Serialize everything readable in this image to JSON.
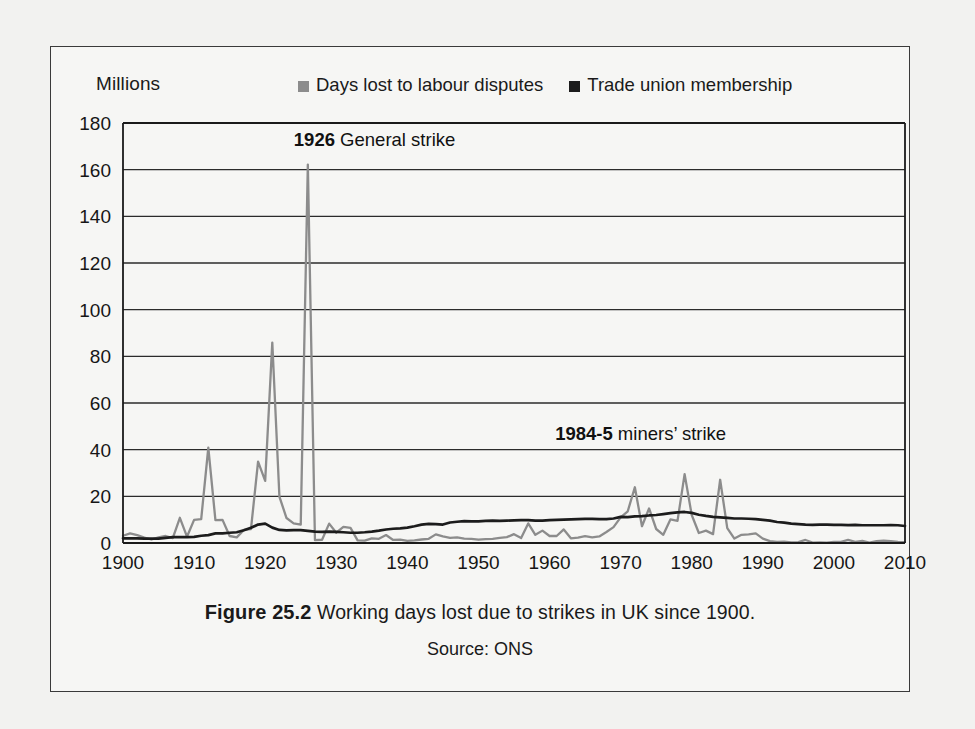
{
  "figure": {
    "axis_unit_label": "Millions",
    "caption_figure_no": "Figure 25.2",
    "caption_text": "Working days lost due to strikes in UK since 1900.",
    "caption_source": "Source: ONS"
  },
  "colors": {
    "days_lost": "#8c8c8c",
    "union_membership": "#1c1c1c",
    "axis": "#1a1a1a",
    "grid": "#2b2b2b",
    "paper": "#f2f2f0",
    "figure_bg": "#f6f6f4",
    "border": "#3a3a3a"
  },
  "annotations": [
    {
      "year_label": "1926",
      "text": " General strike",
      "x_year": 1926,
      "y_value": 170
    },
    {
      "year_label": "1984-5",
      "text": " miners’ strike",
      "x_year": 1984,
      "y_value": 44
    }
  ],
  "chart_data": {
    "type": "line",
    "title": "Working days lost due to strikes in UK since 1900.",
    "subtitle": "Source: ONS",
    "xlabel": "",
    "ylabel": "Millions",
    "xlim": [
      1900,
      2010
    ],
    "ylim": [
      0,
      180
    ],
    "ytick_step": 20,
    "xtick_step": 10,
    "grid": "horizontal",
    "legend_position": "top",
    "ytick_labels": [
      "0",
      "20",
      "40",
      "60",
      "80",
      "100",
      "120",
      "140",
      "160",
      "180"
    ],
    "ytick_values": [
      0,
      20,
      40,
      60,
      80,
      100,
      120,
      140,
      160,
      180
    ],
    "xtick_labels": [
      "1900",
      "1910",
      "1920",
      "1930",
      "1940",
      "1950",
      "1960",
      "1970",
      "1980",
      "1990",
      "2000",
      "2010"
    ],
    "xtick_values": [
      1900,
      1910,
      1920,
      1930,
      1940,
      1950,
      1960,
      1970,
      1980,
      1990,
      2000,
      2010
    ],
    "series": [
      {
        "name": "Days lost to labour disputes",
        "color": "#8c8c8c",
        "x": [
          1900,
          1901,
          1902,
          1903,
          1904,
          1905,
          1906,
          1907,
          1908,
          1909,
          1910,
          1911,
          1912,
          1913,
          1914,
          1915,
          1916,
          1917,
          1918,
          1919,
          1920,
          1921,
          1922,
          1923,
          1924,
          1925,
          1926,
          1927,
          1928,
          1929,
          1930,
          1931,
          1932,
          1933,
          1934,
          1935,
          1936,
          1937,
          1938,
          1939,
          1940,
          1941,
          1942,
          1943,
          1944,
          1945,
          1946,
          1947,
          1948,
          1949,
          1950,
          1951,
          1952,
          1953,
          1954,
          1955,
          1956,
          1957,
          1958,
          1959,
          1960,
          1961,
          1962,
          1963,
          1964,
          1965,
          1966,
          1967,
          1968,
          1969,
          1970,
          1971,
          1972,
          1973,
          1974,
          1975,
          1976,
          1977,
          1978,
          1979,
          1980,
          1981,
          1982,
          1983,
          1984,
          1985,
          1986,
          1987,
          1988,
          1989,
          1990,
          1991,
          1992,
          1993,
          1994,
          1995,
          1996,
          1997,
          1998,
          1999,
          2000,
          2001,
          2002,
          2003,
          2004,
          2005,
          2006,
          2007,
          2008,
          2009,
          2010
        ],
        "y": [
          3.1,
          4.1,
          3.4,
          2.3,
          1.5,
          2.4,
          3.0,
          2.1,
          10.8,
          2.7,
          9.9,
          10.2,
          40.9,
          9.8,
          9.9,
          3.0,
          2.4,
          5.6,
          5.9,
          34.9,
          26.6,
          85.9,
          19.9,
          10.7,
          8.4,
          7.9,
          162.2,
          1.2,
          1.4,
          8.3,
          4.4,
          6.9,
          6.5,
          1.1,
          1.0,
          2.0,
          1.8,
          3.4,
          1.3,
          1.4,
          0.9,
          1.1,
          1.5,
          1.8,
          3.7,
          2.8,
          2.2,
          2.4,
          1.9,
          1.8,
          1.4,
          1.7,
          1.8,
          2.2,
          2.5,
          3.8,
          2.1,
          8.4,
          3.5,
          5.3,
          3.0,
          3.0,
          5.8,
          2.0,
          2.3,
          2.9,
          2.4,
          2.8,
          4.7,
          6.8,
          11.0,
          13.6,
          23.9,
          7.2,
          14.8,
          6.0,
          3.5,
          10.1,
          9.5,
          29.5,
          12.0,
          4.3,
          5.3,
          3.8,
          27.1,
          6.4,
          1.9,
          3.5,
          3.7,
          4.1,
          1.9,
          0.8,
          0.5,
          0.6,
          0.3,
          0.4,
          1.3,
          0.2,
          0.3,
          0.2,
          0.5,
          0.5,
          1.3,
          0.5,
          0.9,
          0.2,
          0.8,
          1.0,
          0.8,
          0.5,
          0.4
        ]
      },
      {
        "name": "Trade union membership",
        "color": "#1c1c1c",
        "x": [
          1900,
          1901,
          1902,
          1903,
          1904,
          1905,
          1906,
          1907,
          1908,
          1909,
          1910,
          1911,
          1912,
          1913,
          1914,
          1915,
          1916,
          1917,
          1918,
          1919,
          1920,
          1921,
          1922,
          1923,
          1924,
          1925,
          1926,
          1927,
          1928,
          1929,
          1930,
          1931,
          1932,
          1933,
          1934,
          1935,
          1936,
          1937,
          1938,
          1939,
          1940,
          1941,
          1942,
          1943,
          1944,
          1945,
          1946,
          1947,
          1948,
          1949,
          1950,
          1951,
          1952,
          1953,
          1954,
          1955,
          1956,
          1957,
          1958,
          1959,
          1960,
          1961,
          1962,
          1963,
          1964,
          1965,
          1966,
          1967,
          1968,
          1969,
          1970,
          1971,
          1972,
          1973,
          1974,
          1975,
          1976,
          1977,
          1978,
          1979,
          1980,
          1981,
          1982,
          1983,
          1984,
          1985,
          1986,
          1987,
          1988,
          1989,
          1990,
          1991,
          1992,
          1993,
          1994,
          1995,
          1996,
          1997,
          1998,
          1999,
          2000,
          2001,
          2002,
          2003,
          2004,
          2005,
          2006,
          2007,
          2008,
          2009,
          2010
        ],
        "y": [
          2.0,
          2.0,
          2.0,
          1.9,
          1.9,
          1.9,
          2.2,
          2.5,
          2.5,
          2.5,
          2.6,
          3.1,
          3.4,
          4.1,
          4.1,
          4.4,
          4.6,
          5.5,
          6.5,
          7.9,
          8.3,
          6.6,
          5.6,
          5.4,
          5.5,
          5.5,
          5.2,
          4.9,
          4.8,
          4.9,
          4.8,
          4.6,
          4.4,
          4.4,
          4.6,
          4.9,
          5.3,
          5.8,
          6.1,
          6.3,
          6.6,
          7.2,
          7.9,
          8.2,
          8.1,
          7.9,
          8.8,
          9.1,
          9.4,
          9.3,
          9.3,
          9.5,
          9.6,
          9.5,
          9.6,
          9.7,
          9.8,
          9.8,
          9.6,
          9.6,
          9.8,
          9.9,
          10.0,
          10.1,
          10.2,
          10.3,
          10.3,
          10.2,
          10.2,
          10.5,
          11.2,
          11.1,
          11.4,
          11.5,
          11.8,
          12.0,
          12.4,
          12.8,
          13.1,
          13.3,
          12.9,
          12.1,
          11.6,
          11.2,
          11.0,
          10.8,
          10.5,
          10.5,
          10.4,
          10.2,
          9.9,
          9.6,
          9.0,
          8.7,
          8.3,
          8.1,
          7.9,
          7.8,
          7.9,
          7.9,
          7.8,
          7.8,
          7.7,
          7.8,
          7.6,
          7.6,
          7.6,
          7.6,
          7.7,
          7.6,
          7.3
        ]
      }
    ]
  }
}
